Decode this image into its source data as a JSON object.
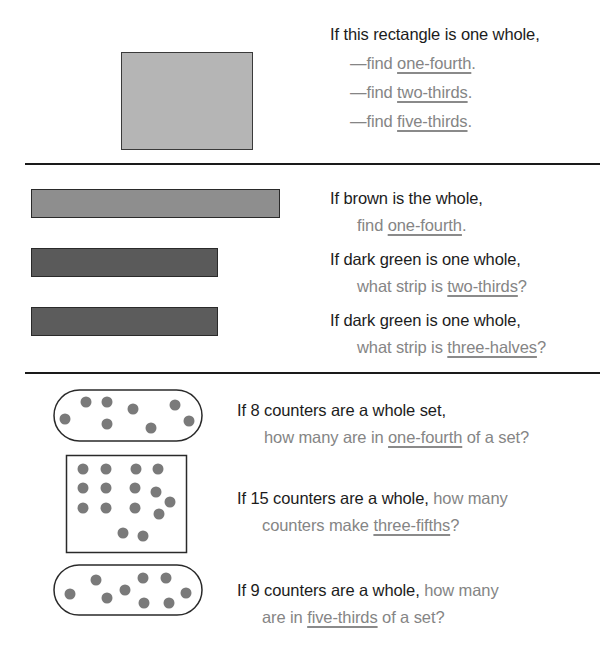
{
  "section1": {
    "prompt": "If this rectangle is one whole,",
    "items": [
      {
        "pre": "—find ",
        "term": "one-fourth",
        "post": "."
      },
      {
        "pre": "—find ",
        "term": "two-thirds",
        "post": "."
      },
      {
        "pre": "—find ",
        "term": "five-thirds",
        "post": "."
      }
    ]
  },
  "section2": {
    "items": [
      {
        "strip": "brown",
        "prompt": "If brown is the whole,",
        "pre": "find ",
        "term": "one-fourth",
        "post": "."
      },
      {
        "strip": "dark green",
        "prompt": "If dark green is one whole,",
        "pre": "what strip is ",
        "term": "two-thirds",
        "post": "?"
      },
      {
        "strip": "dark green",
        "prompt": "If dark green is one whole,",
        "pre": "what strip is ",
        "term": "three-halves",
        "post": "?"
      }
    ]
  },
  "section3": {
    "items": [
      {
        "counters": 8,
        "container": "oval",
        "prompt": "If 8 counters are a whole set,",
        "inline": "",
        "pre": "how many are in ",
        "term": "one-fourth",
        "post": " of a set?"
      },
      {
        "counters": 15,
        "container": "box",
        "prompt": "If 15 counters are a whole,",
        "inline": " how many",
        "pre": "counters make ",
        "term": "three-fifths",
        "post": "?"
      },
      {
        "counters": 9,
        "container": "oval",
        "prompt": "If 9 counters are a whole,",
        "inline": " how many",
        "pre": "are in ",
        "term": "five-thirds",
        "post": " of a set?"
      }
    ]
  },
  "colors": {
    "text_dark": "#1c1c1c",
    "text_grey": "#858585",
    "counter": "#7a7a7a",
    "rectangle_fill": "#b5b5b5",
    "brown_strip": "#8e8e8e",
    "dark_green_strip": "#5a5a5a"
  }
}
